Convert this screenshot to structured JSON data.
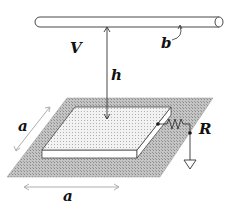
{
  "diagram": {
    "labels": {
      "potential": "V",
      "wire_radius": "b",
      "height": "h",
      "resistance": "R",
      "side_depth": "a",
      "side_width": "a"
    },
    "colors": {
      "ground_plane": "#b8b8b8",
      "plate_top": "#ececec",
      "plate_side": "#ffffff",
      "stroke": "#222222",
      "dimension_line": "#888888"
    }
  }
}
